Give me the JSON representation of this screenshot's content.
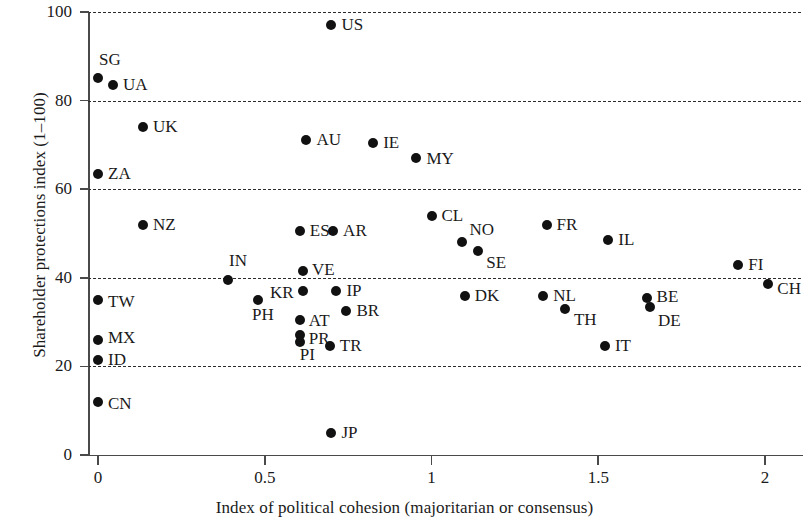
{
  "chart_data": {
    "type": "scatter",
    "title": "",
    "xlabel": "Index of political cohesion (majoritarian or consensus)",
    "ylabel": "Shareholder protections index (1–100)",
    "xlim": [
      -0.06,
      2.08
    ],
    "ylim": [
      0,
      100
    ],
    "xticks": [
      0,
      0.5,
      1,
      1.5,
      2
    ],
    "xticklabels": [
      "0",
      "0.5",
      "1",
      "1.5",
      "2"
    ],
    "yticks": [
      0,
      20,
      40,
      60,
      80,
      100
    ],
    "yticklabels": [
      "0",
      "20",
      "40",
      "60",
      "80",
      "100"
    ],
    "grid": "horizontal-dashed",
    "legend": "none",
    "point_color": "#111111",
    "points": [
      {
        "label": "US",
        "x": 0.7,
        "y": 97,
        "lx": 10,
        "ly": -9
      },
      {
        "label": "SG",
        "x": 0.0,
        "y": 85,
        "lx": 1,
        "ly": -27
      },
      {
        "label": "UA",
        "x": 0.045,
        "y": 83.5,
        "lx": 10,
        "ly": -9
      },
      {
        "label": "UK",
        "x": 0.135,
        "y": 74,
        "lx": 10,
        "ly": -9
      },
      {
        "label": "ZA",
        "x": 0.0,
        "y": 63.5,
        "lx": 10,
        "ly": -9
      },
      {
        "label": "AU",
        "x": 0.625,
        "y": 71,
        "lx": 10,
        "ly": -9
      },
      {
        "label": "IE",
        "x": 0.825,
        "y": 70.5,
        "lx": 10,
        "ly": -9
      },
      {
        "label": "MY",
        "x": 0.955,
        "y": 67,
        "lx": 10,
        "ly": -8
      },
      {
        "label": "NZ",
        "x": 0.135,
        "y": 52,
        "lx": 10,
        "ly": -9
      },
      {
        "label": "ES",
        "x": 0.605,
        "y": 50.5,
        "lx": 10,
        "ly": -9
      },
      {
        "label": "AR",
        "x": 0.705,
        "y": 50.5,
        "lx": 10,
        "ly": -9
      },
      {
        "label": "CL",
        "x": 1.0,
        "y": 54,
        "lx": 10,
        "ly": -9
      },
      {
        "label": "NO",
        "x": 1.09,
        "y": 48,
        "lx": 8,
        "ly": -21
      },
      {
        "label": "SE",
        "x": 1.14,
        "y": 46,
        "lx": 8,
        "ly": 3
      },
      {
        "label": "FR",
        "x": 1.345,
        "y": 52,
        "lx": 10,
        "ly": -9
      },
      {
        "label": "IL",
        "x": 1.53,
        "y": 48.5,
        "lx": 10,
        "ly": -9
      },
      {
        "label": "FI",
        "x": 1.92,
        "y": 43,
        "lx": 10,
        "ly": -9
      },
      {
        "label": "CH",
        "x": 2.01,
        "y": 38.5,
        "lx": 9,
        "ly": -4
      },
      {
        "label": "IN",
        "x": 0.39,
        "y": 39.5,
        "lx": 1,
        "ly": -28
      },
      {
        "label": "VE",
        "x": 0.615,
        "y": 41.5,
        "lx": 9,
        "ly": -10
      },
      {
        "label": "KR",
        "x": 0.615,
        "y": 37,
        "lx": -33,
        "ly": -7
      },
      {
        "label": "IP",
        "x": 0.715,
        "y": 37,
        "lx": 10,
        "ly": -9
      },
      {
        "label": "TW",
        "x": 0.0,
        "y": 35,
        "lx": 10,
        "ly": -7
      },
      {
        "label": "PH",
        "x": 0.48,
        "y": 35,
        "lx": -6,
        "ly": 6
      },
      {
        "label": "DK",
        "x": 1.1,
        "y": 36,
        "lx": 10,
        "ly": -9
      },
      {
        "label": "NL",
        "x": 1.335,
        "y": 36,
        "lx": 10,
        "ly": -9
      },
      {
        "label": "TH",
        "x": 1.4,
        "y": 33,
        "lx": 9,
        "ly": 2
      },
      {
        "label": "BE",
        "x": 1.645,
        "y": 35.5,
        "lx": 10,
        "ly": -10
      },
      {
        "label": "DE",
        "x": 1.655,
        "y": 33.5,
        "lx": 8,
        "ly": 5
      },
      {
        "label": "MX",
        "x": 0.0,
        "y": 26,
        "lx": 10,
        "ly": -11
      },
      {
        "label": "ID",
        "x": 0.0,
        "y": 21.5,
        "lx": 10,
        "ly": -9
      },
      {
        "label": "AT",
        "x": 0.605,
        "y": 30.5,
        "lx": 9,
        "ly": -8
      },
      {
        "label": "BR",
        "x": 0.745,
        "y": 32.5,
        "lx": 10,
        "ly": -9
      },
      {
        "label": "PR",
        "x": 0.605,
        "y": 27,
        "lx": 9,
        "ly": -5
      },
      {
        "label": "PI",
        "x": 0.605,
        "y": 25.5,
        "lx": 0,
        "ly": 4
      },
      {
        "label": "TR",
        "x": 0.695,
        "y": 24.5,
        "lx": 10,
        "ly": -9
      },
      {
        "label": "IT",
        "x": 1.52,
        "y": 24.5,
        "lx": 10,
        "ly": -9
      },
      {
        "label": "CN",
        "x": 0.0,
        "y": 12,
        "lx": 10,
        "ly": -7
      },
      {
        "label": "JP",
        "x": 0.7,
        "y": 5,
        "lx": 10,
        "ly": -9
      }
    ]
  }
}
